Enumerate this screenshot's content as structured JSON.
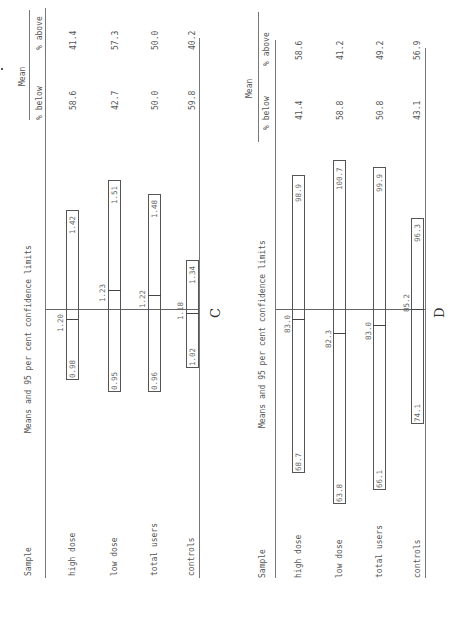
{
  "panels": [
    {
      "letter": "C",
      "header": {
        "sample": "Sample",
        "chart_title": "Means and 95 per cent confidence limits",
        "mean_group": "Mean",
        "below": "% below",
        "above": "% above"
      },
      "rows": [
        {
          "label": "high dose",
          "lower": "0.98",
          "mean": "1.20",
          "upper": "1.42",
          "below": "58.6",
          "above": "41.4"
        },
        {
          "label": "low dose",
          "lower": "0.95",
          "mean": "1.23",
          "upper": "1.51",
          "below": "42.7",
          "above": "57.3"
        },
        {
          "label": "total users",
          "lower": "0.96",
          "mean": "1.22",
          "upper": "1.48",
          "below": "50.0",
          "above": "50.0"
        },
        {
          "label": "controls",
          "lower": "1.02",
          "mean": "1.18",
          "upper": "1.34",
          "below": "59.8",
          "above": "40.2"
        }
      ]
    },
    {
      "letter": "D",
      "header": {
        "sample": "Sample",
        "chart_title": "Means and 95 per cent confidence limits",
        "mean_group": "Mean",
        "below": "% below",
        "above": "% above"
      },
      "rows": [
        {
          "label": "high dose",
          "lower": "68.7",
          "mean": "83.0",
          "upper": "98.9",
          "below": "41.4",
          "above": "58.6"
        },
        {
          "label": "low dose",
          "lower": "63.8",
          "mean": "82.3",
          "upper": "100.7",
          "below": "58.8",
          "above": "41.2"
        },
        {
          "label": "total users",
          "lower": "66.1",
          "mean": "83.0",
          "upper": "99.9",
          "below": "50.8",
          "above": "49.2"
        },
        {
          "label": "controls",
          "lower": "74.1",
          "mean": "85.2",
          "upper": "96.3",
          "below": "43.1",
          "above": "56.9"
        }
      ]
    }
  ]
}
